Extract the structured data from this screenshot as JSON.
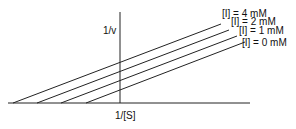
{
  "chart_data": {
    "type": "line",
    "title": "",
    "xlabel": "1/[S]",
    "ylabel": "1/v",
    "grid": false,
    "legend_position": "inline-right",
    "series": [
      {
        "name": "[I] = 4 mM",
        "x_intercept_px": 13,
        "start": [
          13,
          103
        ],
        "end": [
          221,
          24
        ]
      },
      {
        "name": "[I] = 2 mM",
        "x_intercept_px": 37,
        "start": [
          37,
          103
        ],
        "end": [
          229,
          30
        ]
      },
      {
        "name": "[I] = 1 mM",
        "x_intercept_px": 61,
        "start": [
          61,
          103
        ],
        "end": [
          237,
          36
        ]
      },
      {
        "name": "[I] = 0 mM",
        "x_intercept_px": 86,
        "start": [
          86,
          103
        ],
        "end": [
          245,
          42
        ]
      }
    ]
  },
  "axes": {
    "x_label": "1/[S]",
    "y_label": "1/v"
  },
  "legend": [
    "[I] = 4 mM",
    "[I] = 2 mM",
    "[I] = 1 mM",
    "[I] = 0 mM"
  ]
}
